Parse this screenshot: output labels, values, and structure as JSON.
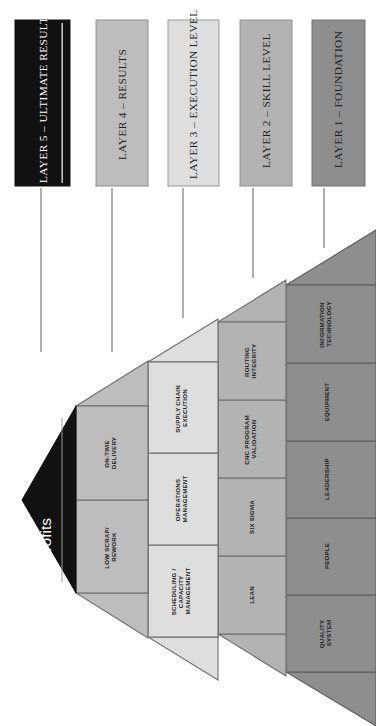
{
  "diagram": {
    "orientation": "rotated-90-apex-left"
  },
  "legend": {
    "items": [
      {
        "id": "layer-5",
        "label": "LAYER 5 – ULTIMATE RESULTS",
        "fill": "#111111",
        "text_color": "#ffffff",
        "stroke": "#111111"
      },
      {
        "id": "layer-4",
        "label": "LAYER 4 – RESULTS",
        "fill": "#bdbdbd",
        "text_color": "#1c1c1c",
        "stroke": "#8f8f8f"
      },
      {
        "id": "layer-3",
        "label": "LAYER 3 – EXECUTION LEVEL",
        "fill": "#dedede",
        "text_color": "#1c1c1c",
        "stroke": "#9a9a9a"
      },
      {
        "id": "layer-2",
        "label": "LAYER 2 – SKILL LEVEL",
        "fill": "#b3b3b3",
        "text_color": "#1c1c1c",
        "stroke": "#8f8f8f"
      },
      {
        "id": "layer-1",
        "label": "LAYER 1 – FOUNDATION",
        "fill": "#8e8e8e",
        "text_color": "#1c1c1c",
        "stroke": "#747474"
      }
    ]
  },
  "pyramid": {
    "apex": {
      "id": "layer-5",
      "label": "Profits",
      "fill": "#111111",
      "text_color": "#ffffff"
    },
    "layers": [
      {
        "id": "layer-4",
        "name": "Results",
        "fill": "#bdbdbd",
        "stroke": "#6f6f6f",
        "cells": [
          {
            "lines": [
              "LOW SCRAP/",
              "REWORK"
            ]
          },
          {
            "lines": [
              "ON-TIME",
              "DELIVERY"
            ]
          }
        ]
      },
      {
        "id": "layer-3",
        "name": "Execution Level",
        "fill": "#dedede",
        "stroke": "#6f6f6f",
        "cells": [
          {
            "lines": [
              "SCHEDULING /",
              "CAPACITY",
              "MANAGEMENT"
            ]
          },
          {
            "lines": [
              "OPERATIONS",
              "MANAGEMENT"
            ]
          },
          {
            "lines": [
              "SUPPLY CHAIN",
              "EXECUTION"
            ]
          }
        ]
      },
      {
        "id": "layer-2",
        "name": "Skill Level",
        "fill": "#b3b3b3",
        "stroke": "#6f6f6f",
        "cells": [
          {
            "lines": [
              "LEAN"
            ]
          },
          {
            "lines": [
              "SIX SIGMA"
            ]
          },
          {
            "lines": [
              "CNC PROGRAM",
              "VALIDATION"
            ]
          },
          {
            "lines": [
              "ROUTING",
              "INTEGRITY"
            ]
          }
        ]
      },
      {
        "id": "layer-1",
        "name": "Foundation",
        "fill": "#8e8e8e",
        "stroke": "#5f5f5f",
        "cells": [
          {
            "lines": [
              "QUALITY",
              "SYSTEM"
            ]
          },
          {
            "lines": [
              "PEOPLE"
            ]
          },
          {
            "lines": [
              "LEADERSHIP"
            ]
          },
          {
            "lines": [
              "EQUIPMENT"
            ]
          },
          {
            "lines": [
              "INFORMATION",
              "TECHNOLOGY"
            ]
          }
        ]
      }
    ]
  },
  "connectors": {
    "stroke": "#7a7a7a",
    "count": 5
  }
}
